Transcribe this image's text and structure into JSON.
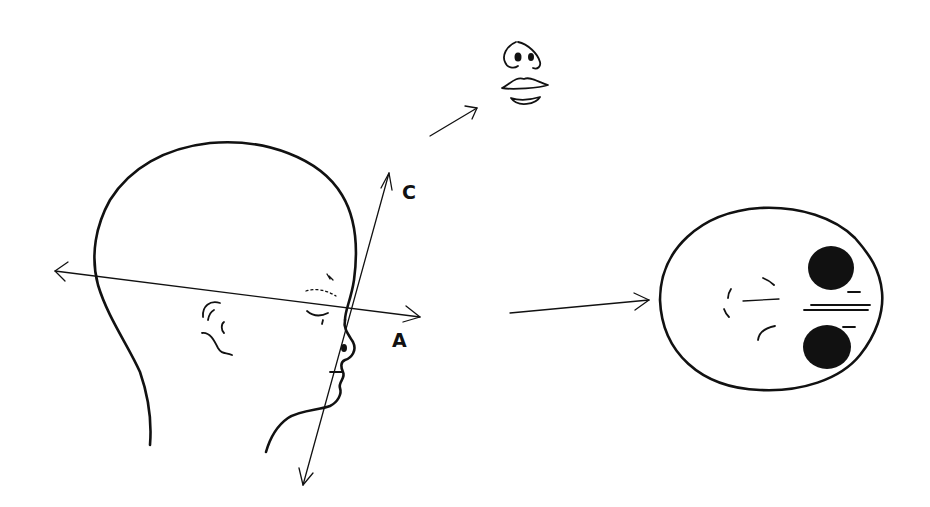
{
  "figure": {
    "type": "anatomical-view-diagram",
    "background": "#ffffff",
    "ink_color": "#111111"
  },
  "labels": {
    "axis_a": "A",
    "axis_c": "C"
  },
  "views": [
    {
      "id": "lateral-profile",
      "description": "side profile of infant head with two projection axes"
    },
    {
      "id": "frontal-inset",
      "description": "nose and mouth seen along axis C"
    },
    {
      "id": "axial-view",
      "description": "head seen along axis A with two dark orbits"
    }
  ],
  "arrows": [
    {
      "id": "axis-a",
      "label": "A",
      "from": [
        55,
        271
      ],
      "to": [
        420,
        317
      ],
      "bidirectional": true
    },
    {
      "id": "axis-c",
      "label": "C",
      "from": [
        303,
        485
      ],
      "to": [
        389,
        173
      ],
      "bidirectional": true
    },
    {
      "id": "to-frontal-view",
      "from": [
        430,
        136
      ],
      "to": [
        477,
        108
      ]
    },
    {
      "id": "to-axial-view",
      "from": [
        510,
        313
      ],
      "to": [
        649,
        300
      ]
    }
  ]
}
